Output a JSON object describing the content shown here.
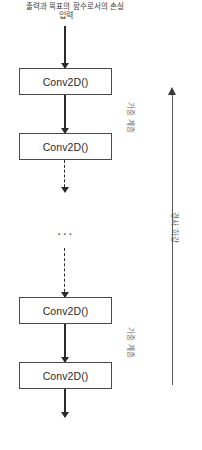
{
  "diagram": {
    "input_label": "입력",
    "loss_caption": "출력과 목표의 함수로서의 손실",
    "ellipsis": "...",
    "layers": [
      {
        "label": "Conv2D()"
      },
      {
        "label": "Conv2D()"
      },
      {
        "label": "Conv2D()"
      },
      {
        "label": "Conv2D()"
      }
    ],
    "side_labels": {
      "weight_layer_top": "가중 계층",
      "weight_layer_bottom": "가중 계층",
      "backprop": "경사 하강"
    },
    "colors": {
      "box_border": "#4a4a4a",
      "arrow": "#2b2b2b",
      "text": "#2b2b2b",
      "side_text": "#6b6b6b",
      "background": "#ffffff"
    }
  }
}
